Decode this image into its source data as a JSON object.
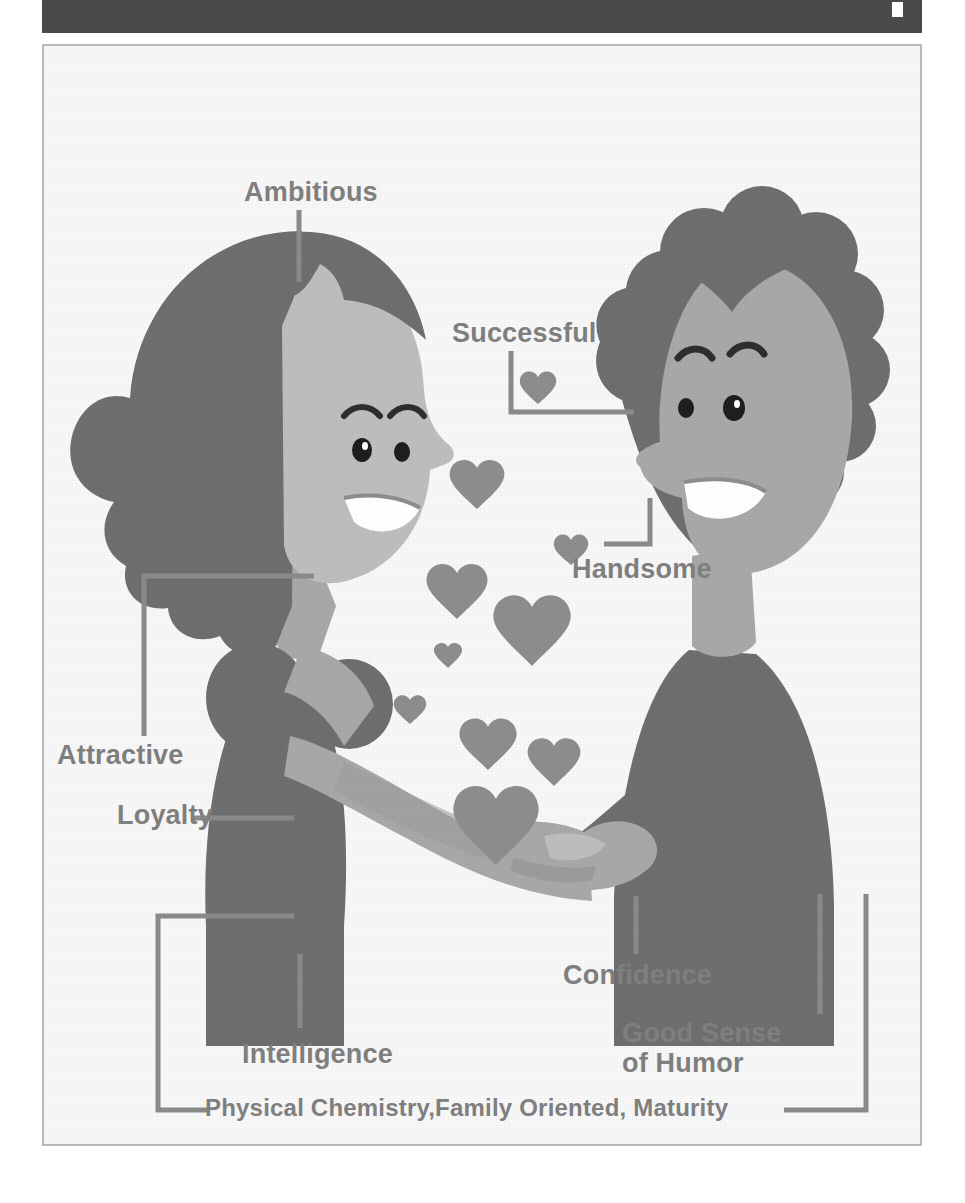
{
  "window": {
    "titlebar_color": "#4a4a4a",
    "marker_icon": "white-square-marker"
  },
  "panel": {
    "background_color": "#f7f7f7",
    "border_color": "#b9b9b9"
  },
  "illustration": {
    "title": "Qualities Couple Illustration",
    "colors": {
      "dark": "#6e6e6e",
      "mid": "#8d8d8d",
      "skin": "#a8a8a8",
      "light": "#bdbdbd",
      "line": "#8a8a8a",
      "text": "#7f7f7f",
      "teeth": "#ffffff"
    },
    "figures": [
      {
        "name": "woman",
        "side": "left",
        "hair": "long-wavy",
        "outfit": "puff-sleeve-dress"
      },
      {
        "name": "man",
        "side": "right",
        "hair": "curly-bumpy",
        "outfit": "suit"
      }
    ],
    "hearts_count": 11
  },
  "labels": {
    "ambitious": "Ambitious",
    "successful": "Successful",
    "handsome": "Handsome",
    "attractive": "Attractive",
    "loyalty": "Loyalty",
    "intelligence": "Intelligence",
    "confidence": "Confidence",
    "humor_line1": "Good Sense",
    "humor_line2": "of Humor",
    "caption": "Physical Chemistry,Family Oriented, Maturity"
  }
}
